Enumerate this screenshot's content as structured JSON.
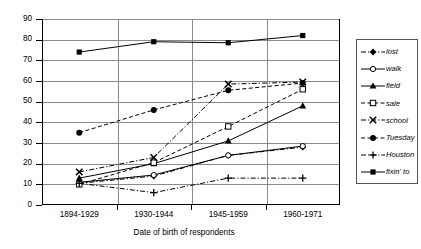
{
  "chart_data": {
    "type": "line",
    "title": "",
    "xlabel": "Date of birth of respondents",
    "ylabel": "Percentage of respondents using innovative form",
    "categories": [
      "1894-1929",
      "1930-1944",
      "1945-1959",
      "1960-1971"
    ],
    "ylim": [
      0,
      90
    ],
    "yticks": [
      0,
      10,
      20,
      30,
      40,
      50,
      60,
      70,
      80,
      90
    ],
    "grid": true,
    "legend_position": "right",
    "series": [
      {
        "name": "lost",
        "marker": "filled-diamond",
        "line": "dash-dot",
        "values": [
          10.5,
          14.0,
          24.0,
          28.0
        ]
      },
      {
        "name": "walk",
        "marker": "open-circle",
        "line": "solid",
        "values": [
          11.0,
          14.5,
          24.0,
          28.5
        ]
      },
      {
        "name": "field",
        "marker": "filled-triangle",
        "line": "solid",
        "values": [
          13.0,
          20.0,
          31.0,
          48.0
        ]
      },
      {
        "name": "sale",
        "marker": "open-square",
        "line": "dashed",
        "values": [
          10.0,
          20.5,
          38.0,
          56.0
        ]
      },
      {
        "name": "school",
        "marker": "cross-x",
        "line": "dash-dot",
        "values": [
          16.0,
          23.0,
          58.5,
          59.5
        ]
      },
      {
        "name": "Tuesday",
        "marker": "filled-circle",
        "line": "dashed",
        "values": [
          35.0,
          46.0,
          55.5,
          59.0
        ]
      },
      {
        "name": "Houston",
        "marker": "plus",
        "line": "dash-dot",
        "values": [
          10.5,
          6.0,
          13.0,
          13.0
        ]
      },
      {
        "name": "fixin' to",
        "marker": "filled-square",
        "line": "solid",
        "values": [
          74.0,
          79.0,
          78.5,
          82.0
        ]
      }
    ]
  },
  "legend": {
    "items": [
      {
        "label": "lost"
      },
      {
        "label": "walk"
      },
      {
        "label": "field"
      },
      {
        "label": "sale"
      },
      {
        "label": "school"
      },
      {
        "label": "Tuesday"
      },
      {
        "label": "Houston"
      },
      {
        "label": "fixin' to"
      }
    ]
  },
  "axes": {
    "y_tick_labels": [
      "90",
      "80",
      "70",
      "60",
      "50",
      "40",
      "30",
      "20",
      "10",
      "0"
    ],
    "x_tick_labels": [
      "1894-1929",
      "1930-1944",
      "1945-1959",
      "1960-1971"
    ]
  }
}
